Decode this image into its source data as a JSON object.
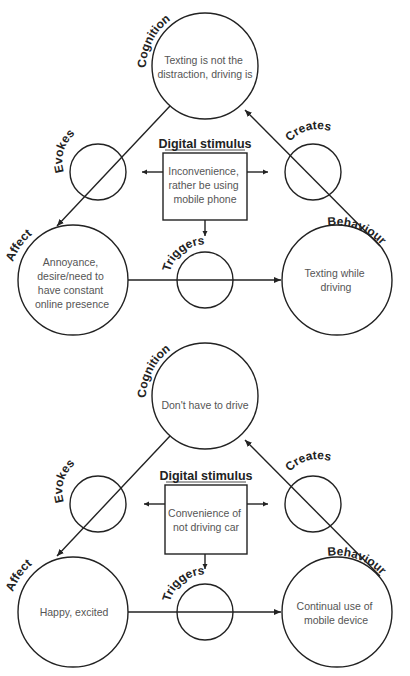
{
  "diagrams": [
    {
      "cognition": {
        "label": "Cognition",
        "lines": [
          "Texting is not the",
          "distraction, driving is"
        ]
      },
      "evokes": {
        "label": "Evokes"
      },
      "creates": {
        "label": "Creates"
      },
      "stimulus": {
        "title": "Digital stimulus",
        "lines": [
          "Inconvenience,",
          "rather be using",
          "mobile phone"
        ]
      },
      "affect": {
        "label": "Affect",
        "lines": [
          "Annoyance,",
          "desire/need to",
          "have constant",
          "online presence"
        ]
      },
      "triggers": {
        "label": "Triggers"
      },
      "behaviour": {
        "label": "Behaviour",
        "lines": [
          "Texting while",
          "driving"
        ]
      }
    },
    {
      "cognition": {
        "label": "Cognition",
        "lines": [
          "Don't have to drive"
        ]
      },
      "evokes": {
        "label": "Evokes"
      },
      "creates": {
        "label": "Creates"
      },
      "stimulus": {
        "title": "Digital stimulus",
        "lines": [
          "Convenience of",
          "not driving car"
        ]
      },
      "affect": {
        "label": "Affect",
        "lines": [
          "Happy, excited"
        ]
      },
      "triggers": {
        "label": "Triggers"
      },
      "behaviour": {
        "label": "Behaviour",
        "lines": [
          "Continual use of",
          "mobile device"
        ]
      }
    }
  ],
  "colors": {
    "stroke": "#222222",
    "text": "#555555",
    "background": "#ffffff"
  }
}
